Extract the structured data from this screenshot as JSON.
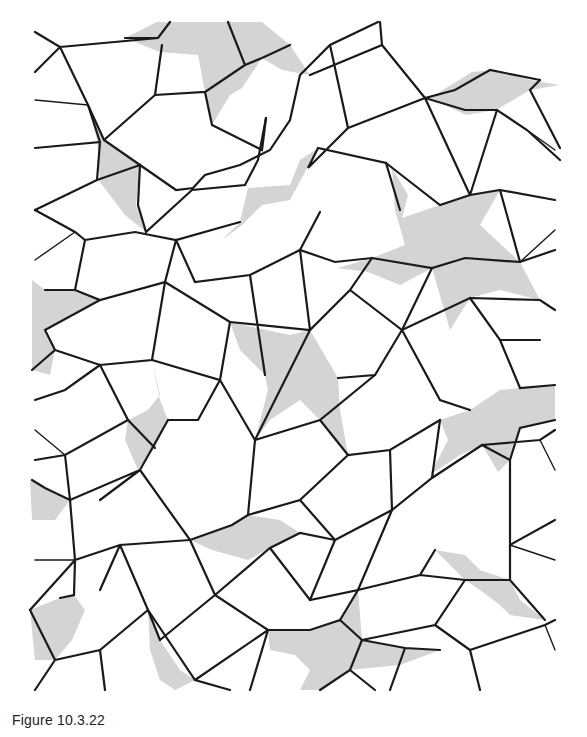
{
  "figure": {
    "shade_color": "#d4d4d4",
    "line_color": "#1a1a1a",
    "background": "#ffffff"
  },
  "caption": {
    "text": "Figure 10.3.22"
  }
}
